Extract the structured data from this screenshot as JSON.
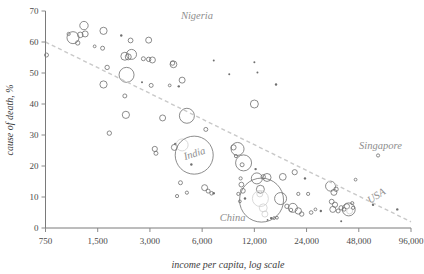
{
  "chart_data": {
    "type": "scatter",
    "title": "",
    "subtitle": "",
    "xlabel": "income per capita, log scale",
    "ylabel": "cause of death, %",
    "xscale": "log",
    "xlim": [
      750,
      96000
    ],
    "ylim": [
      0,
      70
    ],
    "xticks": [
      750,
      1500,
      3000,
      6000,
      12000,
      24000,
      48000,
      96000
    ],
    "xtick_labels": [
      "750",
      "1,500",
      "3,000",
      "6,000",
      "12,000",
      "24,000",
      "48,000",
      "96,000"
    ],
    "yticks": [
      0,
      10,
      20,
      30,
      40,
      50,
      60,
      70
    ],
    "ytick_labels": [
      "0",
      "10",
      "20",
      "30",
      "40",
      "50",
      "60",
      "70"
    ],
    "grid": false,
    "legend": "none",
    "colors": {
      "bubble_stroke": "#6f6f6f",
      "bubble_faint": "#cfcfcf",
      "trendline": "#c9c9c9",
      "axis": "#7a7a7a",
      "annotation": "#8e8e8e",
      "text": "#3d3d3d"
    },
    "trendline": {
      "style": "dashed",
      "points": [
        [
          750,
          60.0
        ],
        [
          96000,
          2.0
        ]
      ]
    },
    "annotations": [
      {
        "label": "Nigeria",
        "x": 5600,
        "y": 67.5,
        "rotation": 0
      },
      {
        "label": "India",
        "x": 5500,
        "y": 23.0,
        "rotation": -18
      },
      {
        "label": "China",
        "x": 9000,
        "y": 2.2,
        "rotation": 0
      },
      {
        "label": "Singapore",
        "x": 64000,
        "y": 25.5,
        "rotation": 0
      },
      {
        "label": "USA",
        "x": 62000,
        "y": 9.5,
        "rotation": -32
      }
    ],
    "bubble_size_meaning": "population",
    "points": [
      {
        "x": 760,
        "y": 55.8,
        "r": 2.0
      },
      {
        "x": 1020,
        "y": 62.6,
        "r": 1.6
      },
      {
        "x": 1080,
        "y": 61.4,
        "r": 6.0
      },
      {
        "x": 1190,
        "y": 62.3,
        "r": 2.8
      },
      {
        "x": 1150,
        "y": 59.7,
        "r": 2.2
      },
      {
        "x": 1250,
        "y": 65.3,
        "r": 4.2
      },
      {
        "x": 1270,
        "y": 62.6,
        "r": 3.0
      },
      {
        "x": 1440,
        "y": 58.6,
        "r": 1.4
      },
      {
        "x": 1620,
        "y": 63.6,
        "r": 3.6
      },
      {
        "x": 1600,
        "y": 58.0,
        "r": 2.0
      },
      {
        "x": 1700,
        "y": 51.8,
        "r": 2.2
      },
      {
        "x": 1620,
        "y": 46.3,
        "r": 3.6
      },
      {
        "x": 1750,
        "y": 30.6,
        "r": 2.2
      },
      {
        "x": 2050,
        "y": 62.1,
        "r": 1.2
      },
      {
        "x": 2150,
        "y": 55.4,
        "r": 4.0
      },
      {
        "x": 2250,
        "y": 55.2,
        "r": 3.0
      },
      {
        "x": 2320,
        "y": 60.5,
        "r": 2.4
      },
      {
        "x": 2350,
        "y": 56.0,
        "r": 5.0
      },
      {
        "x": 2200,
        "y": 49.4,
        "r": 7.5
      },
      {
        "x": 2150,
        "y": 42.6,
        "r": 2.0
      },
      {
        "x": 2180,
        "y": 36.5,
        "r": 3.6
      },
      {
        "x": 2750,
        "y": 54.6,
        "r": 2.0
      },
      {
        "x": 2950,
        "y": 60.6,
        "r": 3.0
      },
      {
        "x": 2950,
        "y": 54.4,
        "r": 2.2
      },
      {
        "x": 3100,
        "y": 54.2,
        "r": 3.0
      },
      {
        "x": 3050,
        "y": 46.0,
        "r": 2.0
      },
      {
        "x": 3200,
        "y": 25.5,
        "r": 2.6
      },
      {
        "x": 3250,
        "y": 24.1,
        "r": 2.0
      },
      {
        "x": 2700,
        "y": 47.0,
        "r": 1.0
      },
      {
        "x": 3550,
        "y": 35.5,
        "r": 3.0
      },
      {
        "x": 3900,
        "y": 46.0,
        "r": 1.4
      },
      {
        "x": 4050,
        "y": 53.2,
        "r": 2.2
      },
      {
        "x": 4100,
        "y": 52.8,
        "r": 3.4
      },
      {
        "x": 4400,
        "y": 45.7,
        "r": 1.2
      },
      {
        "x": 4150,
        "y": 26.0,
        "r": 3.0
      },
      {
        "x": 4200,
        "y": 27.1,
        "r": 1.2
      },
      {
        "x": 4600,
        "y": 47.7,
        "r": 3.0
      },
      {
        "x": 4900,
        "y": 36.2,
        "r": 7.5
      },
      {
        "x": 4600,
        "y": 26.8,
        "r": 6.0,
        "faint": true
      },
      {
        "x": 5400,
        "y": 23.5,
        "r": 19.0
      },
      {
        "x": 5200,
        "y": 20.5,
        "r": 1.2
      },
      {
        "x": 4500,
        "y": 14.6,
        "r": 2.0
      },
      {
        "x": 4300,
        "y": 10.3,
        "r": 1.6
      },
      {
        "x": 4900,
        "y": 11.4,
        "r": 1.6
      },
      {
        "x": 6300,
        "y": 31.8,
        "r": 2.0
      },
      {
        "x": 6200,
        "y": 13.0,
        "r": 3.0
      },
      {
        "x": 6500,
        "y": 11.9,
        "r": 2.0
      },
      {
        "x": 6800,
        "y": 11.2,
        "r": 1.8
      },
      {
        "x": 7000,
        "y": 11.2,
        "r": 1.2
      },
      {
        "x": 8600,
        "y": 49.6,
        "r": 1.0
      },
      {
        "x": 7000,
        "y": 54.0,
        "r": 1.0
      },
      {
        "x": 9100,
        "y": 26.0,
        "r": 2.6
      },
      {
        "x": 9400,
        "y": 23.2,
        "r": 1.6
      },
      {
        "x": 9600,
        "y": 25.5,
        "r": 6.5
      },
      {
        "x": 10400,
        "y": 21.0,
        "r": 8.0
      },
      {
        "x": 10200,
        "y": 20.4,
        "r": 2.0
      },
      {
        "x": 10000,
        "y": 16.0,
        "r": 1.6
      },
      {
        "x": 10100,
        "y": 14.0,
        "r": 2.4
      },
      {
        "x": 10300,
        "y": 12.0,
        "r": 2.4
      },
      {
        "x": 9700,
        "y": 11.0,
        "r": 1.6
      },
      {
        "x": 9900,
        "y": 8.6,
        "r": 1.4
      },
      {
        "x": 10600,
        "y": 9.5,
        "r": 1.2
      },
      {
        "x": 12000,
        "y": 40.0,
        "r": 4.0
      },
      {
        "x": 12500,
        "y": 50.2,
        "r": 1.0
      },
      {
        "x": 12000,
        "y": 53.5,
        "r": 1.0
      },
      {
        "x": 12200,
        "y": 19.0,
        "r": 1.2
      },
      {
        "x": 12400,
        "y": 16.0,
        "r": 5.5
      },
      {
        "x": 13500,
        "y": 16.5,
        "r": 2.2
      },
      {
        "x": 14200,
        "y": 16.3,
        "r": 4.0
      },
      {
        "x": 13000,
        "y": 12.5,
        "r": 4.0
      },
      {
        "x": 13200,
        "y": 9.0,
        "r": 22.0
      },
      {
        "x": 13000,
        "y": 9.5,
        "r": 8.0,
        "faint": true
      },
      {
        "x": 13500,
        "y": 6.5,
        "r": 4.0,
        "faint": true
      },
      {
        "x": 13800,
        "y": 4.5,
        "r": 3.0,
        "faint": true
      },
      {
        "x": 12900,
        "y": 11.0,
        "r": 3.0,
        "faint": true
      },
      {
        "x": 15000,
        "y": 3.2,
        "r": 1.2
      },
      {
        "x": 15600,
        "y": 3.2,
        "r": 1.4
      },
      {
        "x": 16200,
        "y": 3.3,
        "r": 1.4
      },
      {
        "x": 14300,
        "y": 2.6,
        "r": 0.9
      },
      {
        "x": 16000,
        "y": 46.3,
        "r": 1.2
      },
      {
        "x": 17500,
        "y": 16.5,
        "r": 3.4
      },
      {
        "x": 17000,
        "y": 9.5,
        "r": 6.0
      },
      {
        "x": 18500,
        "y": 7.0,
        "r": 2.2
      },
      {
        "x": 19500,
        "y": 5.8,
        "r": 1.8
      },
      {
        "x": 20500,
        "y": 18.0,
        "r": 2.6
      },
      {
        "x": 21500,
        "y": 11.0,
        "r": 1.6
      },
      {
        "x": 20000,
        "y": 6.5,
        "r": 4.5
      },
      {
        "x": 21500,
        "y": 5.5,
        "r": 3.2
      },
      {
        "x": 22500,
        "y": 4.5,
        "r": 2.2
      },
      {
        "x": 23500,
        "y": 16.0,
        "r": 1.2
      },
      {
        "x": 24500,
        "y": 11.0,
        "r": 1.6
      },
      {
        "x": 25500,
        "y": 5.0,
        "r": 1.8
      },
      {
        "x": 27000,
        "y": 6.0,
        "r": 1.4
      },
      {
        "x": 29000,
        "y": 5.5,
        "r": 1.2
      },
      {
        "x": 33000,
        "y": 13.5,
        "r": 5.0
      },
      {
        "x": 34500,
        "y": 11.5,
        "r": 3.0
      },
      {
        "x": 35500,
        "y": 12.5,
        "r": 2.2
      },
      {
        "x": 33500,
        "y": 8.5,
        "r": 2.4
      },
      {
        "x": 35000,
        "y": 7.5,
        "r": 2.6
      },
      {
        "x": 34000,
        "y": 6.0,
        "r": 3.0
      },
      {
        "x": 36500,
        "y": 5.5,
        "r": 2.0
      },
      {
        "x": 38000,
        "y": 6.5,
        "r": 2.2
      },
      {
        "x": 39500,
        "y": 6.0,
        "r": 1.8
      },
      {
        "x": 41000,
        "y": 7.0,
        "r": 2.6
      },
      {
        "x": 42000,
        "y": 6.0,
        "r": 6.5
      },
      {
        "x": 42500,
        "y": 5.5,
        "r": 3.0,
        "faint": true
      },
      {
        "x": 44000,
        "y": 8.0,
        "r": 1.6
      },
      {
        "x": 44500,
        "y": 6.5,
        "r": 1.6
      },
      {
        "x": 46000,
        "y": 15.6,
        "r": 1.4
      },
      {
        "x": 38000,
        "y": 2.2,
        "r": 1.0
      },
      {
        "x": 62000,
        "y": 23.4,
        "r": 1.6
      },
      {
        "x": 80000,
        "y": 6.0,
        "r": 1.2
      },
      {
        "x": 58000,
        "y": 7.5,
        "r": 1.2
      }
    ]
  }
}
